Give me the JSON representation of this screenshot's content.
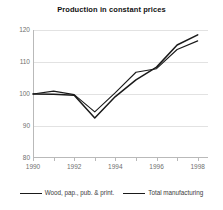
{
  "chart_data": {
    "type": "line",
    "title": "Production in constant prices",
    "xlabel": "",
    "ylabel": "",
    "xlim": [
      1990,
      1998.5
    ],
    "ylim": [
      80,
      120
    ],
    "grid": true,
    "legend_position": "bottom",
    "y_ticks": [
      120,
      110,
      100,
      90,
      80
    ],
    "x_ticks": [
      1990,
      1991,
      1992,
      1993,
      1994,
      1995,
      1996,
      1997,
      1998
    ],
    "x_tick_labels": [
      "1990",
      "",
      "1992",
      "",
      "1994",
      "",
      "1996",
      "",
      "1998"
    ],
    "x": [
      1990,
      1991,
      1992,
      1993,
      1994,
      1995,
      1996,
      1997,
      1998
    ],
    "series": [
      {
        "name": "Wood, pap., pub. & print.",
        "color": "#1a1a1a",
        "values": [
          100.0,
          100.9,
          99.8,
          94.4,
          100.4,
          106.8,
          107.9,
          113.9,
          116.6
        ]
      },
      {
        "name": "Total manufacturing",
        "color": "#1a1a1a",
        "values": [
          100.0,
          99.9,
          99.6,
          92.5,
          99.2,
          104.4,
          108.4,
          115.3,
          118.5
        ]
      }
    ]
  },
  "legend": {
    "entries": [
      {
        "label": "Wood, pap., pub. & print."
      },
      {
        "label": "Total manufacturing"
      }
    ]
  },
  "axis": {
    "y_labels": [
      "120",
      "110",
      "100",
      "90",
      "80"
    ],
    "x_labels": [
      "1990",
      "1992",
      "1994",
      "1996",
      "1998"
    ]
  },
  "colors": {
    "series_a": "#1a1a1a",
    "series_b": "#1a1a1a",
    "grid": "#e2e2e2",
    "axis": "#b9b9b9",
    "tick_text": "#6f6f6f",
    "title_text": "#111111"
  }
}
